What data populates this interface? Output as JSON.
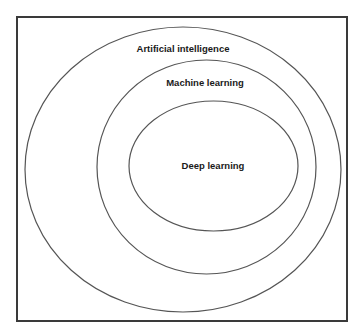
{
  "diagram": {
    "type": "nested-venn",
    "frame": {
      "x": 17,
      "y": 17,
      "width": 330,
      "height": 304,
      "stroke": "#3a3a3a"
    },
    "ellipses": [
      {
        "id": "outer",
        "label": "Artificial intelligence",
        "cx": 183,
        "cy": 169.5,
        "rx": 158,
        "ry": 142.5,
        "label_x": 183,
        "label_y": 52
      },
      {
        "id": "middle",
        "label": "Machine learning",
        "cx": 206.5,
        "cy": 167,
        "rx": 109.5,
        "ry": 107,
        "label_x": 205,
        "label_y": 86
      },
      {
        "id": "inner",
        "label": "Deep learning",
        "cx": 213.5,
        "cy": 166,
        "rx": 84.5,
        "ry": 65,
        "label_x": 213,
        "label_y": 169
      }
    ],
    "stroke_color": "#555555",
    "text_color": "#1a1a1a",
    "background": "#ffffff"
  }
}
